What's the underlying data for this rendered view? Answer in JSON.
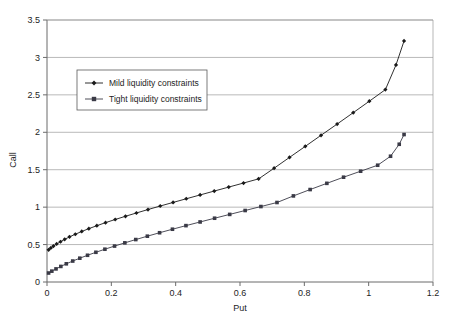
{
  "chart_data": {
    "type": "line",
    "title": "",
    "xlabel": "Put",
    "ylabel": "Call",
    "xlim": [
      0,
      1.2
    ],
    "ylim": [
      0,
      3.5
    ],
    "xticks": [
      "0",
      "0.2",
      "0.4",
      "0.6",
      "0.8",
      "1",
      "1.2"
    ],
    "xtick_values": [
      0,
      0.2,
      0.4,
      0.6,
      0.8,
      1.0,
      1.2
    ],
    "yticks": [
      "0",
      "0.5",
      "1",
      "1.5",
      "2",
      "2.5",
      "3",
      "3.5"
    ],
    "ytick_values": [
      0,
      0.5,
      1.0,
      1.5,
      2.0,
      2.5,
      3.0,
      3.5
    ],
    "grid": "horizontal",
    "legend_position": "upper-left-inside",
    "series": [
      {
        "name": "Mild liquidity constraints",
        "marker": "filled-diamond",
        "color": "#1a1a1a",
        "x": [
          0.005,
          0.012,
          0.02,
          0.03,
          0.042,
          0.055,
          0.07,
          0.088,
          0.108,
          0.13,
          0.155,
          0.182,
          0.212,
          0.244,
          0.278,
          0.314,
          0.352,
          0.392,
          0.433,
          0.476,
          0.52,
          0.565,
          0.611,
          0.658,
          0.706,
          0.754,
          0.803,
          0.852,
          0.902,
          0.952,
          1.002,
          1.052,
          1.085,
          1.11
        ],
        "y": [
          0.43,
          0.455,
          0.48,
          0.508,
          0.538,
          0.57,
          0.603,
          0.638,
          0.675,
          0.713,
          0.752,
          0.793,
          0.835,
          0.878,
          0.922,
          0.968,
          1.015,
          1.063,
          1.112,
          1.163,
          1.215,
          1.268,
          1.322,
          1.378,
          1.52,
          1.665,
          1.812,
          1.96,
          2.11,
          2.262,
          2.415,
          2.57,
          2.9,
          3.22
        ]
      },
      {
        "name": "Tight liquidity constraints",
        "marker": "filled-square",
        "color": "#3a3a46",
        "x": [
          0.005,
          0.015,
          0.028,
          0.043,
          0.06,
          0.08,
          0.102,
          0.126,
          0.152,
          0.18,
          0.21,
          0.242,
          0.276,
          0.312,
          0.35,
          0.39,
          0.432,
          0.476,
          0.521,
          0.568,
          0.616,
          0.665,
          0.715,
          0.766,
          0.818,
          0.87,
          0.922,
          0.975,
          1.028,
          1.068,
          1.095,
          1.11
        ],
        "y": [
          0.12,
          0.145,
          0.175,
          0.208,
          0.243,
          0.28,
          0.318,
          0.357,
          0.397,
          0.438,
          0.48,
          0.523,
          0.567,
          0.612,
          0.658,
          0.705,
          0.753,
          0.802,
          0.852,
          0.903,
          0.955,
          1.008,
          1.062,
          1.15,
          1.235,
          1.318,
          1.4,
          1.48,
          1.56,
          1.68,
          1.84,
          1.97
        ]
      }
    ]
  },
  "axes": {
    "y_axis_title": "Call",
    "x_axis_title": "Put"
  },
  "legend": {
    "entries": [
      {
        "label": "Mild liquidity constraints"
      },
      {
        "label": "Tight liquidity constraints"
      }
    ]
  }
}
